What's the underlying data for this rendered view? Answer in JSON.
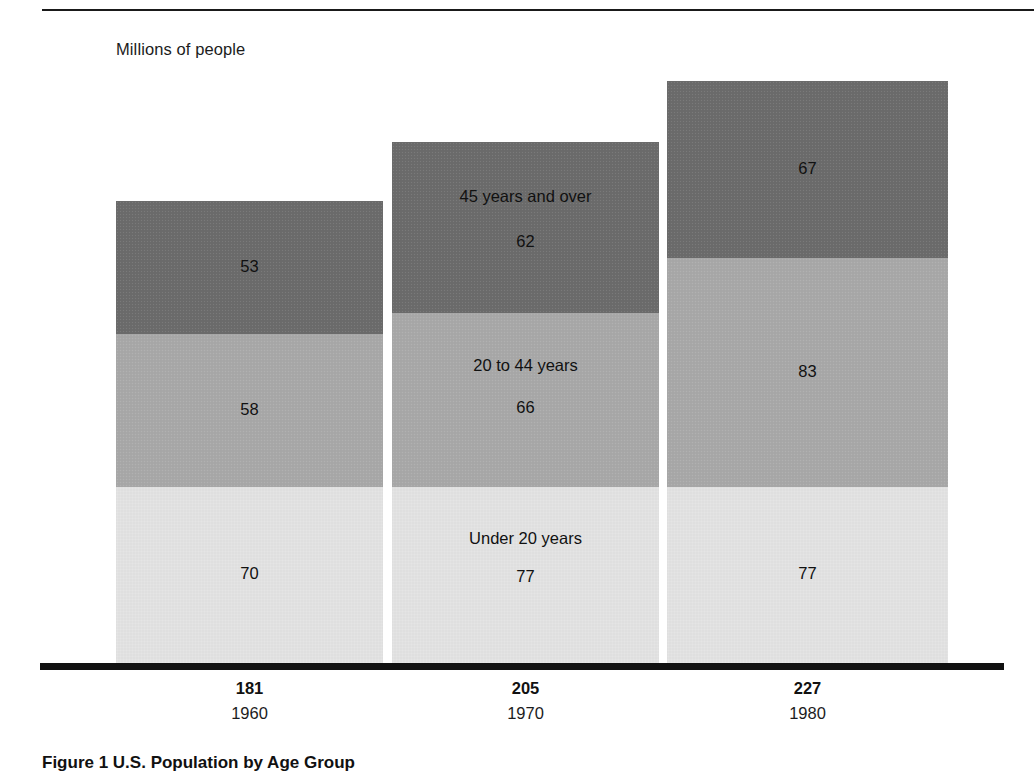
{
  "figure": {
    "unit_label": "Millions of people",
    "caption": "Figure 1  U.S. Population by Age Group",
    "rule_color": "#1a1a1a",
    "axis_color": "#111111"
  },
  "chart_data": {
    "type": "bar",
    "stacked": true,
    "title": "Figure 1  U.S. Population by Age Group",
    "subtitle": "",
    "xlabel": "",
    "ylabel": "Millions of people",
    "ylim": [
      0,
      227
    ],
    "grid": false,
    "legend": "in-bar (middle column labelled)",
    "categories": [
      "1960",
      "1970",
      "1980"
    ],
    "category_totals": [
      181,
      205,
      227
    ],
    "series": [
      {
        "name": "Under 20 years",
        "values": [
          70,
          77,
          77
        ],
        "color": "#e2e2e2"
      },
      {
        "name": "20 to 44 years",
        "values": [
          58,
          66,
          83
        ],
        "color": "#a8a8a8"
      },
      {
        "name": "45 years and over",
        "values": [
          53,
          62,
          67
        ],
        "color": "#6b6b6b"
      }
    ],
    "bars": [
      {
        "year": "1960",
        "total": "181",
        "segments": [
          {
            "key": "over45",
            "value": "53",
            "label": "",
            "color": "#6b6b6b"
          },
          {
            "key": "mid2044",
            "value": "58",
            "label": "",
            "color": "#a8a8a8"
          },
          {
            "key": "under20",
            "value": "70",
            "label": "",
            "color": "#e2e2e2"
          }
        ]
      },
      {
        "year": "1970",
        "total": "205",
        "segments": [
          {
            "key": "over45",
            "value": "62",
            "label": "45 years and over",
            "color": "#6b6b6b"
          },
          {
            "key": "mid2044",
            "value": "66",
            "label": "20 to 44 years",
            "color": "#a8a8a8"
          },
          {
            "key": "under20",
            "value": "77",
            "label": "Under 20 years",
            "color": "#e2e2e2"
          }
        ]
      },
      {
        "year": "1980",
        "total": "227",
        "segments": [
          {
            "key": "over45",
            "value": "67",
            "label": "",
            "color": "#6b6b6b"
          },
          {
            "key": "mid2044",
            "value": "83",
            "label": "",
            "color": "#a8a8a8"
          },
          {
            "key": "under20",
            "value": "77",
            "label": "",
            "color": "#e2e2e2"
          }
        ]
      }
    ]
  },
  "geometry": {
    "baseline_y": 663,
    "bars": [
      {
        "left": 116,
        "width": 267,
        "tops": {
          "over45": 201,
          "mid2044": 334,
          "under20": 487
        }
      },
      {
        "left": 392,
        "width": 267,
        "tops": {
          "over45": 142,
          "mid2044": 313,
          "under20": 487
        }
      },
      {
        "left": 667,
        "width": 281,
        "tops": {
          "over45": 81,
          "mid2044": 258,
          "under20": 487
        }
      }
    ]
  }
}
